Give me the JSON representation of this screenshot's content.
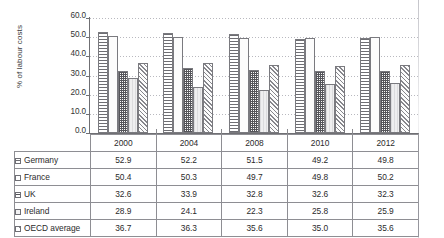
{
  "chart_data": {
    "type": "bar",
    "title": "",
    "subtitle": "",
    "xlabel": "",
    "ylabel": "% of labour costs",
    "ylim": [
      0.0,
      60.0
    ],
    "ytick_step": 10.0,
    "ytick_labels": [
      "0.0",
      "10.0",
      "20.0",
      "30.0",
      "40.0",
      "50.0",
      "60.0"
    ],
    "grid": true,
    "grid_axis": "y",
    "legend_position": "table-row-headers",
    "categories": [
      "2000",
      "2004",
      "2008",
      "2010",
      "2012"
    ],
    "series": [
      {
        "name": "Germany",
        "values": [
          52.9,
          52.2,
          51.5,
          49.2,
          49.8
        ],
        "pattern": "horizontal-lines"
      },
      {
        "name": "France",
        "values": [
          50.4,
          50.3,
          49.7,
          49.8,
          50.2
        ],
        "pattern": "fine-grid"
      },
      {
        "name": "UK",
        "values": [
          32.6,
          33.9,
          32.8,
          32.6,
          32.3
        ],
        "pattern": "coarse-dots"
      },
      {
        "name": "Ireland",
        "values": [
          28.9,
          24.1,
          22.3,
          25.8,
          25.9
        ],
        "pattern": "light-solid"
      },
      {
        "name": "OECD average",
        "values": [
          36.7,
          36.3,
          35.6,
          35.0,
          35.6
        ],
        "pattern": "diagonal-hatch"
      }
    ]
  },
  "axis": {
    "y_title": "% of labour costs",
    "ticks": [
      "60.0",
      "50.0",
      "40.0",
      "30.0",
      "20.0",
      "10.0",
      "0.0"
    ]
  },
  "table": {
    "corner_label": "",
    "year_headers": [
      "2000",
      "2004",
      "2008",
      "2010",
      "2012"
    ],
    "rows": [
      {
        "label": "Germany",
        "values": [
          "52.9",
          "52.2",
          "51.5",
          "49.2",
          "49.8"
        ]
      },
      {
        "label": "France",
        "values": [
          "50.4",
          "50.3",
          "49.7",
          "49.8",
          "50.2"
        ]
      },
      {
        "label": "UK",
        "values": [
          "32.6",
          "33.9",
          "32.8",
          "32.6",
          "32.3"
        ]
      },
      {
        "label": "Ireland",
        "values": [
          "28.9",
          "24.1",
          "22.3",
          "25.8",
          "25.9"
        ]
      },
      {
        "label": "OECD average",
        "values": [
          "36.7",
          "36.3",
          "35.6",
          "35.0",
          "35.6"
        ]
      }
    ]
  },
  "colors": {
    "axis": "#6f6f73",
    "grid": "#b9b9bf",
    "border": "#8e8e93",
    "text": "#2b2b2b"
  }
}
